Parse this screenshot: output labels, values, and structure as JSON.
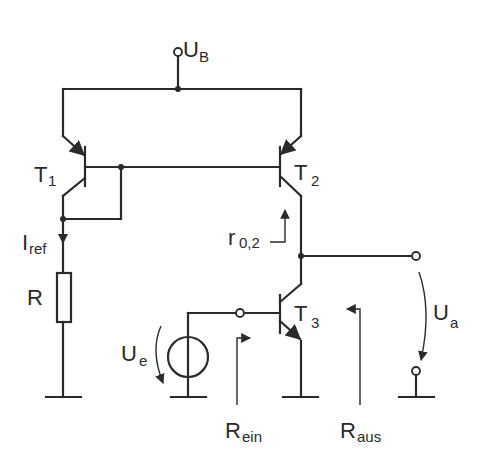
{
  "diagram": {
    "type": "circuit-schematic",
    "colors": {
      "ink": "#2a2a2a",
      "background": "#ffffff"
    },
    "labels": {
      "supply": {
        "main": "U",
        "sub": "B"
      },
      "t1": {
        "main": "T",
        "sub": "1"
      },
      "t2": {
        "main": "T",
        "sub": "2"
      },
      "t3": {
        "main": "T",
        "sub": "3"
      },
      "iref": {
        "main": "I",
        "sub": "ref"
      },
      "resistor": {
        "main": "R"
      },
      "r02": {
        "main": "r",
        "sub": "0,2"
      },
      "ue": {
        "main": "U",
        "sub": "e"
      },
      "ua": {
        "main": "U",
        "sub": "a"
      },
      "rein": {
        "main": "R",
        "sub": "ein"
      },
      "raus": {
        "main": "R",
        "sub": "aus"
      }
    },
    "components": [
      {
        "id": "T1",
        "type": "pnp-transistor",
        "role": "reference (diode-connected)"
      },
      {
        "id": "T2",
        "type": "pnp-transistor",
        "role": "current mirror output"
      },
      {
        "id": "T3",
        "type": "npn-transistor",
        "role": "common emitter amplifier"
      },
      {
        "id": "R",
        "type": "resistor",
        "role": "sets I_ref"
      },
      {
        "id": "Ue",
        "type": "voltage-source",
        "role": "input signal"
      }
    ]
  }
}
